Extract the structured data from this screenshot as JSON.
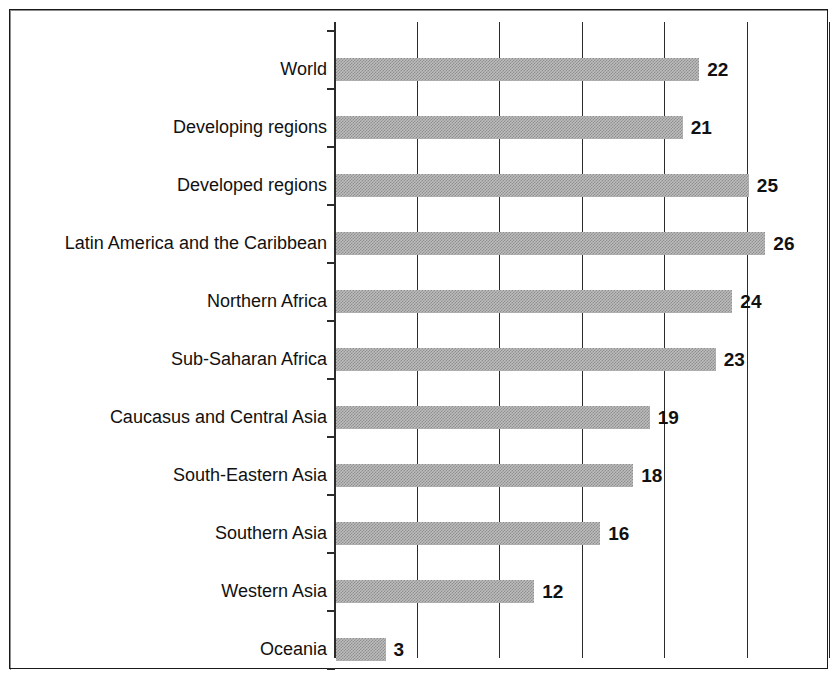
{
  "chart_data": {
    "type": "bar",
    "orientation": "horizontal",
    "title": "",
    "subtitle": "",
    "xlabel": "",
    "ylabel": "",
    "xlim": [
      0,
      30.4
    ],
    "ylim": null,
    "grid": "vertical",
    "legend": null,
    "gridlines": [
      5,
      10,
      15,
      20,
      25,
      30
    ],
    "tick_labels_x": [],
    "categories": [
      "World",
      "Developing regions",
      "Developed regions",
      "Latin America and the Caribbean",
      "Northern Africa",
      "Sub-Saharan Africa",
      "Caucasus and Central Asia",
      "South-Eastern Asia",
      "Southern Asia",
      "Western Asia",
      "Oceania"
    ],
    "values": [
      22,
      21,
      25,
      26,
      24,
      23,
      19,
      18,
      16,
      12,
      3
    ],
    "value_labels": [
      "22",
      "21",
      "25",
      "26",
      "24",
      "23",
      "19",
      "18",
      "16",
      "12",
      "3"
    ],
    "series": [
      {
        "name": "",
        "values": [
          22,
          21,
          25,
          26,
          24,
          23,
          19,
          18,
          16,
          12,
          3
        ]
      }
    ],
    "bar_color": "#a8a8a8",
    "bar_pattern": "50% dither / halftone gray",
    "axis_color": "#2b2b2b",
    "text_color": "#111111",
    "background": "#ffffff"
  }
}
